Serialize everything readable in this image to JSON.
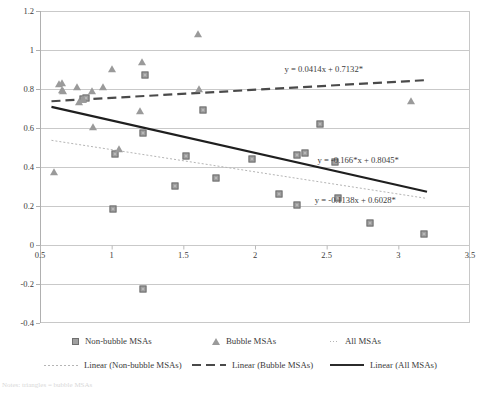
{
  "chart_data": {
    "type": "scatter",
    "title": "",
    "xlabel": "",
    "ylabel": "",
    "xlim": [
      0.5,
      3.5
    ],
    "ylim": [
      -0.4,
      1.2
    ],
    "xticks": [
      "0.5",
      "1",
      "1.5",
      "2",
      "2.5",
      "3",
      "3.5"
    ],
    "xtick_values": [
      0.5,
      1,
      1.5,
      2,
      2.5,
      3,
      3.5
    ],
    "yticks": [
      "1.2",
      "1",
      "0.8",
      "0.6",
      "0.4",
      "0.2",
      "0",
      "-0.2",
      "-0.4"
    ],
    "ytick_values": [
      1.2,
      1.0,
      0.8,
      0.6,
      0.4,
      0.2,
      0,
      -0.2,
      -0.4
    ],
    "grid": true,
    "legend_position": "bottom",
    "series": [
      {
        "name": "Non-bubble MSAs",
        "marker": "square",
        "color": "#a0a0a0",
        "points": [
          [
            0.8,
            0.748
          ],
          [
            0.82,
            0.752
          ],
          [
            1.01,
            0.186
          ],
          [
            1.02,
            0.468
          ],
          [
            1.22,
            0.572
          ],
          [
            1.23,
            0.872
          ],
          [
            1.22,
            -0.228
          ],
          [
            1.44,
            0.304
          ],
          [
            1.52,
            0.456
          ],
          [
            1.64,
            0.694
          ],
          [
            1.73,
            0.345
          ],
          [
            1.98,
            0.443
          ],
          [
            2.17,
            0.259
          ],
          [
            2.29,
            0.459
          ],
          [
            2.29,
            0.207
          ],
          [
            2.35,
            0.47
          ],
          [
            2.45,
            0.623
          ],
          [
            2.56,
            0.424
          ],
          [
            2.58,
            0.241
          ],
          [
            2.8,
            0.115
          ],
          [
            3.18,
            0.055
          ]
        ]
      },
      {
        "name": "Bubble MSAs",
        "marker": "triangle",
        "color": "#9a9a9a",
        "points": [
          [
            0.6,
            0.372
          ],
          [
            0.63,
            0.826
          ],
          [
            0.65,
            0.832
          ],
          [
            0.65,
            0.795
          ],
          [
            0.66,
            0.79
          ],
          [
            0.76,
            0.81
          ],
          [
            0.77,
            0.732
          ],
          [
            0.8,
            0.75
          ],
          [
            0.86,
            0.79
          ],
          [
            0.87,
            0.606
          ],
          [
            0.94,
            0.812
          ],
          [
            1.0,
            0.905
          ],
          [
            1.05,
            0.49
          ],
          [
            1.2,
            0.688
          ],
          [
            1.21,
            0.94
          ],
          [
            1.6,
            1.082
          ],
          [
            1.61,
            0.8
          ],
          [
            3.09,
            0.738
          ]
        ]
      }
    ],
    "trendlines": [
      {
        "name": "Linear (Non-bubble MSAs)",
        "style": "dotted",
        "color": "#b5b5b5",
        "equation": "y = -0.1138x + 0.6028*",
        "slope": -0.1138,
        "intercept": 0.6028,
        "x_from": 0.58,
        "x_to": 3.2
      },
      {
        "name": "Linear (Bubble MSAs)",
        "style": "dashed",
        "color": "#4a4a4a",
        "equation": "y = 0.0414x + 0.7132*",
        "slope": 0.0414,
        "intercept": 0.7132,
        "x_from": 0.58,
        "x_to": 3.2
      },
      {
        "name": "Linear (All MSAs)",
        "style": "solid",
        "color": "#1f1f1f",
        "equation": "y = -0.166*x + 0.8045*",
        "slope": -0.166,
        "intercept": 0.8045,
        "x_from": 0.58,
        "x_to": 3.2
      }
    ],
    "annotations": [
      {
        "text": "y = 0.0414x + 0.7132*",
        "x": 2.48,
        "y": 0.895
      },
      {
        "text": "y = -0.166*x + 0.8045*",
        "x": 2.72,
        "y": 0.43
      },
      {
        "text": "y = -0.1138x + 0.6028*",
        "x": 2.7,
        "y": 0.225
      }
    ]
  },
  "legend": {
    "row1": [
      {
        "label": "Non-bubble MSAs",
        "marker": "square-marker"
      },
      {
        "label": "Bubble MSAs",
        "marker": "triangle-marker"
      },
      {
        "label": "All MSAs",
        "marker": "dot-marker"
      }
    ],
    "row2": [
      {
        "label": "Linear (Non-bubble MSAs)",
        "marker": "dotted-line"
      },
      {
        "label": "Linear (Bubble MSAs)",
        "marker": "dashed-line"
      },
      {
        "label": "Linear (All MSAs)",
        "marker": "solid-line"
      }
    ]
  },
  "footnote": "Notes: triangles = bubble MSAs"
}
